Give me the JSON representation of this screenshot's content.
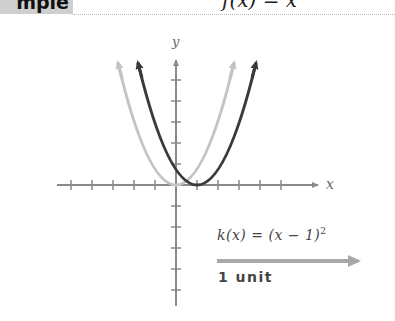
{
  "header": {
    "tab_label": "Example",
    "tab_visible_text": "mple",
    "formula": "f(x) = x²"
  },
  "graph": {
    "axis_labels": {
      "x": "x",
      "y": "y"
    },
    "parent_function": {
      "name": "f(x) = x²",
      "color": "#c4c4c4",
      "vertex": [
        0,
        0
      ]
    },
    "transformed_function": {
      "name": "k(x) = (x − 1)²",
      "color": "#3a3a3a",
      "vertex": [
        1,
        0
      ]
    },
    "x_ticks": [
      -5,
      -4,
      -3,
      -2,
      -1,
      1,
      2,
      3,
      4,
      5
    ],
    "y_ticks_above": [
      1,
      2,
      3,
      4,
      5,
      6
    ],
    "y_ticks_below": [
      -1,
      -2,
      -3,
      -4,
      -5
    ]
  },
  "annotation": {
    "equation_prefix": "k(x) = (x − 1)",
    "equation_exponent": "2",
    "shift_label": "1 unit",
    "shift_direction": "right"
  }
}
